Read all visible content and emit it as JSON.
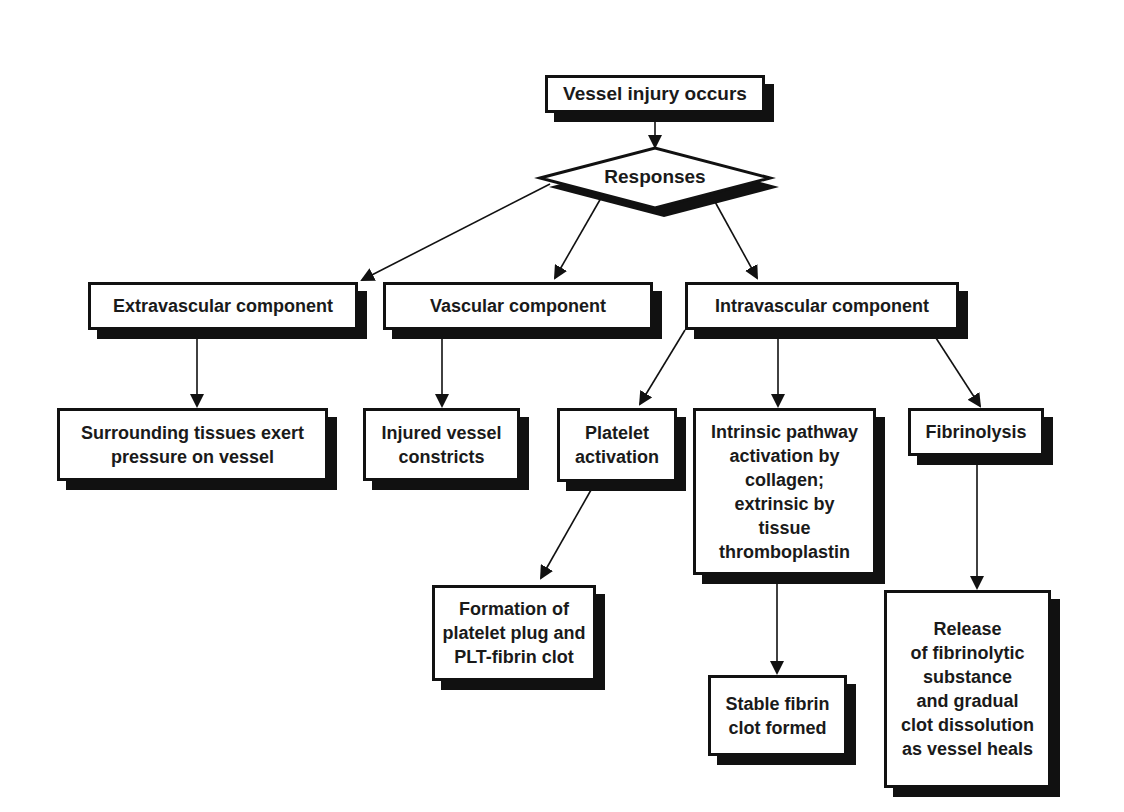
{
  "diagram": {
    "type": "flowchart",
    "colors": {
      "line": "#111111",
      "box_fill": "#ffffff",
      "shadow": "#111111",
      "text": "#1a1a1a"
    },
    "nodes": {
      "vessel_injury": {
        "label": "Vessel injury occurs",
        "shape": "box"
      },
      "responses": {
        "label": "Responses",
        "shape": "diamond"
      },
      "extravascular": {
        "label": "Extravascular component",
        "shape": "box"
      },
      "vascular": {
        "label": "Vascular component",
        "shape": "box"
      },
      "intravascular": {
        "label": "Intravascular component",
        "shape": "box"
      },
      "surrounding": {
        "label": "Surrounding tissues exert\npressure on vessel",
        "shape": "box"
      },
      "injured_vessel": {
        "label": "Injured vessel\nconstricts",
        "shape": "box"
      },
      "platelet_activation": {
        "label": "Platelet\nactivation",
        "shape": "box"
      },
      "intrinsic": {
        "label": "Intrinsic pathway\nactivation by\ncollagen;\nextrinsic by\ntissue\nthromboplastin",
        "shape": "box"
      },
      "fibrinolysis": {
        "label": "Fibrinolysis",
        "shape": "box"
      },
      "platelet_plug": {
        "label": "Formation of\nplatelet plug and\nPLT-fibrin clot",
        "shape": "box"
      },
      "stable_clot": {
        "label": "Stable fibrin\nclot formed",
        "shape": "box"
      },
      "release": {
        "label": "Release\nof fibrinolytic\nsubstance\nand gradual\nclot dissolution\nas vessel heals",
        "shape": "box"
      }
    },
    "edges": [
      {
        "from": "vessel_injury",
        "to": "responses"
      },
      {
        "from": "responses",
        "to": "extravascular"
      },
      {
        "from": "responses",
        "to": "vascular"
      },
      {
        "from": "responses",
        "to": "intravascular"
      },
      {
        "from": "extravascular",
        "to": "surrounding"
      },
      {
        "from": "vascular",
        "to": "injured_vessel"
      },
      {
        "from": "intravascular",
        "to": "platelet_activation"
      },
      {
        "from": "intravascular",
        "to": "intrinsic"
      },
      {
        "from": "intravascular",
        "to": "fibrinolysis"
      },
      {
        "from": "platelet_activation",
        "to": "platelet_plug"
      },
      {
        "from": "intrinsic",
        "to": "stable_clot"
      },
      {
        "from": "fibrinolysis",
        "to": "release"
      }
    ]
  }
}
